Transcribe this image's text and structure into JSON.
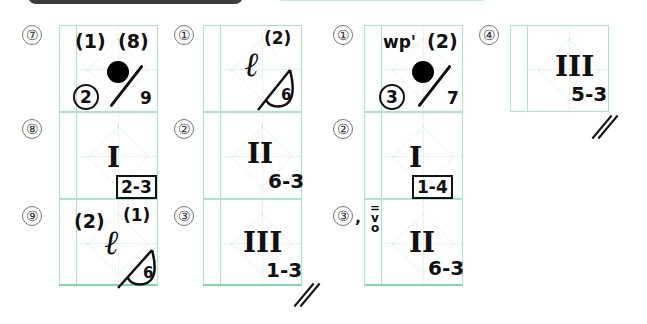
{
  "header": {
    "left_banner_color": "#3c3c3c",
    "right_banner_color": "#bff0d6"
  },
  "colors": {
    "grid": "#a8e6c4",
    "grid_bottom": "#7fd9a8",
    "ink": "#111111"
  },
  "left_section": {
    "col1": [
      {
        "number": "⑦",
        "marks": {
          "top_left": "(1)",
          "top_right": "(8)",
          "center": "black-dot",
          "circled": "2",
          "slash_value": "9"
        }
      },
      {
        "number": "⑧",
        "marks": {
          "roman": "I",
          "boxed": "2-3"
        }
      },
      {
        "number": "⑨",
        "marks": {
          "top_left": "(2)",
          "ell": "ℓ",
          "superscript": "(1)",
          "triangle_value": "6"
        }
      }
    ],
    "col2": [
      {
        "number": "①",
        "marks": {
          "ell": "ℓ",
          "superscript": "(2)",
          "triangle_value": "6"
        }
      },
      {
        "number": "②",
        "marks": {
          "roman": "II",
          "fingering": "6-3"
        }
      },
      {
        "number": "③",
        "marks": {
          "roman": "III",
          "fingering": "1-3",
          "double_slash": "//"
        }
      }
    ]
  },
  "right_section": {
    "col1": [
      {
        "number": "①",
        "marks": {
          "top_left": "wp'",
          "top_right": "(2)",
          "center": "black-dot",
          "circled": "3",
          "slash_value": "7"
        }
      },
      {
        "number": "②",
        "marks": {
          "roman": "I",
          "boxed": "1-4"
        }
      },
      {
        "number": "③",
        "suffix": ",",
        "side_note": "=\nv\no",
        "marks": {
          "roman": "II",
          "fingering": "6-3"
        }
      }
    ],
    "col2": [
      {
        "number": "④",
        "marks": {
          "roman": "III",
          "fingering": "5-3",
          "double_slash": "//"
        }
      }
    ]
  }
}
